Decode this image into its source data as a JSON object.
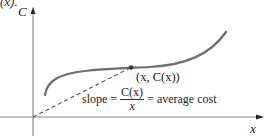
{
  "header_fragment": "(x).",
  "axes": {
    "y_label": "C",
    "x_label": "x"
  },
  "point_label": "(x, C(x))",
  "annotation": {
    "prefix": "slope =",
    "numerator": "C(x)",
    "denominator": "x",
    "suffix": "= average cost"
  },
  "colors": {
    "curve": "#6e6e6e",
    "axes": "#888888",
    "text": "#222222"
  }
}
